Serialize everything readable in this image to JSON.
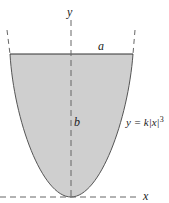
{
  "diagram": {
    "type": "tank cross-section",
    "labels": {
      "y_axis": "y",
      "x_axis": "x",
      "width": "a",
      "depth": "b",
      "curve_lhs": "y = k|x|",
      "curve_exp": "3"
    },
    "colors": {
      "fill": "#cfcfcf",
      "stroke": "#555555",
      "axis": "#666666"
    }
  }
}
